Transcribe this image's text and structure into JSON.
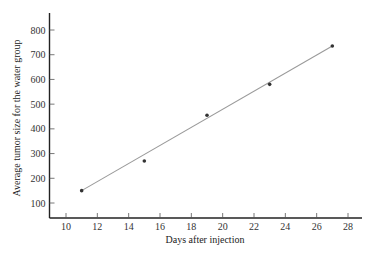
{
  "chart_data": {
    "type": "scatter",
    "title": "",
    "xlabel": "Days after injection",
    "ylabel": "Average tumor size for the water group",
    "xlim": [
      9,
      29
    ],
    "ylim": [
      40,
      870
    ],
    "xticks": [
      10,
      12,
      14,
      16,
      18,
      20,
      22,
      24,
      26,
      28
    ],
    "yticks": [
      100,
      200,
      300,
      400,
      500,
      600,
      700,
      800
    ],
    "grid": false,
    "legend": null,
    "series": [
      {
        "name": "Water group",
        "type": "scatter",
        "x": [
          11,
          15,
          19,
          23,
          27
        ],
        "y": [
          150,
          270,
          455,
          580,
          735
        ]
      },
      {
        "name": "Fitted line",
        "type": "line",
        "x": [
          11,
          27
        ],
        "y": [
          150,
          735
        ]
      }
    ],
    "colors": {
      "points": "#333333",
      "line": "#9a9a9a",
      "axis": "#222222"
    }
  }
}
